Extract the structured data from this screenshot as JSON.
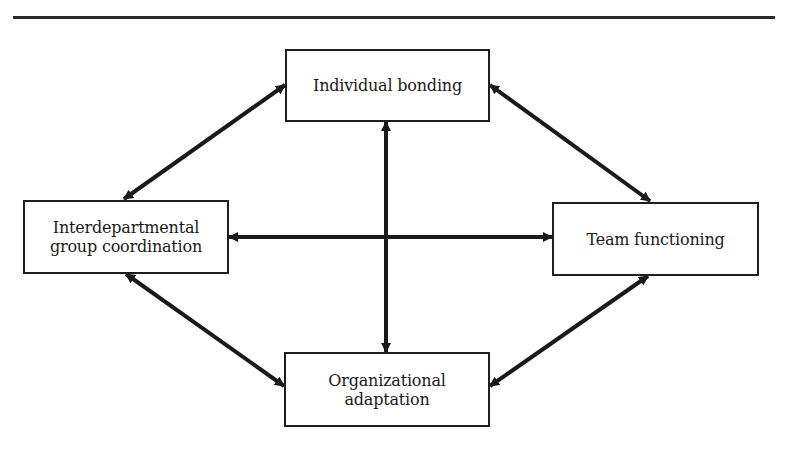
{
  "diagram": {
    "type": "concept-map",
    "line_color": "#1a1a1a",
    "nodes": {
      "top": {
        "id": "individual-bonding",
        "lines": [
          "Individual bonding"
        ]
      },
      "left": {
        "id": "interdepartmental-group-coordination",
        "lines": [
          "Interdepartmental",
          "group coordination"
        ]
      },
      "right": {
        "id": "team-functioning",
        "lines": [
          "Team functioning"
        ]
      },
      "bottom": {
        "id": "organizational-adaptation",
        "lines": [
          "Organizational",
          "adaptation"
        ]
      }
    },
    "edges": [
      {
        "from": "interdepartmental-group-coordination",
        "to": "individual-bonding",
        "direction": "bidirectional"
      },
      {
        "from": "individual-bonding",
        "to": "team-functioning",
        "direction": "bidirectional"
      },
      {
        "from": "interdepartmental-group-coordination",
        "to": "organizational-adaptation",
        "direction": "bidirectional"
      },
      {
        "from": "team-functioning",
        "to": "organizational-adaptation",
        "direction": "bidirectional"
      },
      {
        "from": "interdepartmental-group-coordination",
        "to": "team-functioning",
        "direction": "bidirectional"
      },
      {
        "from": "individual-bonding",
        "to": "organizational-adaptation",
        "direction": "bidirectional"
      }
    ]
  }
}
